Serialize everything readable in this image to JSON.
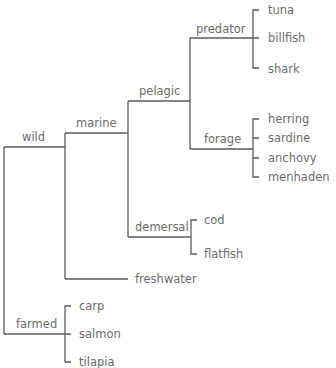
{
  "diagram": {
    "type": "dendrogram",
    "colors": {
      "line": "#5a5a5a",
      "text": "#6b6b6b",
      "background": "#ffffff"
    },
    "nodes": [
      {
        "id": "wild",
        "label": "wild",
        "parent": null
      },
      {
        "id": "farmed",
        "label": "farmed",
        "parent": null
      },
      {
        "id": "marine",
        "label": "marine",
        "parent": "wild"
      },
      {
        "id": "freshwater",
        "label": "freshwater",
        "parent": "wild"
      },
      {
        "id": "pelagic",
        "label": "pelagic",
        "parent": "marine"
      },
      {
        "id": "demersal",
        "label": "demersal",
        "parent": "marine"
      },
      {
        "id": "predator",
        "label": "predator",
        "parent": "pelagic"
      },
      {
        "id": "forage",
        "label": "forage",
        "parent": "pelagic"
      },
      {
        "id": "tuna",
        "label": "tuna",
        "parent": "predator"
      },
      {
        "id": "billfish",
        "label": "billfish",
        "parent": "predator"
      },
      {
        "id": "shark",
        "label": "shark",
        "parent": "predator"
      },
      {
        "id": "herring",
        "label": "herring",
        "parent": "forage"
      },
      {
        "id": "sardine",
        "label": "sardine",
        "parent": "forage"
      },
      {
        "id": "anchovy",
        "label": "anchovy",
        "parent": "forage"
      },
      {
        "id": "menhaden",
        "label": "menhaden",
        "parent": "forage"
      },
      {
        "id": "cod",
        "label": "cod",
        "parent": "demersal"
      },
      {
        "id": "flatfish",
        "label": "flatfish",
        "parent": "demersal"
      },
      {
        "id": "carp",
        "label": "carp",
        "parent": "farmed"
      },
      {
        "id": "salmon",
        "label": "salmon",
        "parent": "farmed"
      },
      {
        "id": "tilapia",
        "label": "tilapia",
        "parent": "farmed"
      }
    ]
  }
}
